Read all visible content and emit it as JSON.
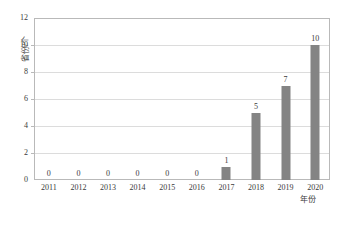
{
  "chart_data": {
    "type": "bar",
    "title": "",
    "xlabel": "年份",
    "ylabel": "省份/个",
    "categories": [
      "2011",
      "2012",
      "2013",
      "2014",
      "2015",
      "2016",
      "2017",
      "2018",
      "2019",
      "2020"
    ],
    "values": [
      0,
      0,
      0,
      0,
      0,
      0,
      1,
      5,
      7,
      10
    ],
    "data_labels": [
      "0",
      "0",
      "0",
      "0",
      "0",
      "0",
      "1",
      "5",
      "7",
      "10"
    ],
    "ylim": [
      0,
      12
    ],
    "ytick_labels": [
      "0",
      "2",
      "4",
      "6",
      "8",
      "10",
      "12"
    ],
    "ytick_values": [
      0,
      2,
      4,
      6,
      8,
      10,
      12
    ],
    "grid": true,
    "grid_axis": "y",
    "legend": false,
    "series": [
      {
        "name": "省份/个",
        "values": [
          0,
          0,
          0,
          0,
          0,
          0,
          1,
          5,
          7,
          10
        ],
        "color": "#848484"
      }
    ],
    "colors": {
      "bar": "#848484",
      "gridline": "#dcdcdc",
      "axis": "#b9b9b9",
      "text": "#3a3a3a",
      "background": "#ffffff"
    }
  }
}
